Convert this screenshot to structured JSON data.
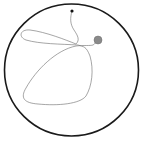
{
  "diagram": {
    "type": "morris-water-maze-trajectory",
    "pool": {
      "cx": 71.5,
      "cy": 70,
      "rx": 67,
      "ry": 66,
      "stroke": "#1a1a1a",
      "stroke_width": 1.6
    },
    "start_point": {
      "cx": 72,
      "cy": 11,
      "r": 1.6,
      "color": "#111111"
    },
    "platform": {
      "cx": 98,
      "cy": 40,
      "r": 4,
      "color": "#8a8a8a",
      "stroke": "#6e6e6e"
    },
    "trajectory": {
      "color": "#6a6a6a",
      "stroke_width": 0.6,
      "path": "M72,11 C70,18 70,24 74,30 C78,36 80,40 76,44 C66,40 46,32 30,30 C20,29 18,37 26,40 C40,44 60,44 78,45 C84,47 86,46 90,56 C94,70 92,86 86,96 C80,104 58,106 38,104 C24,103 20,98 26,88 C36,70 56,50 76,46 C84,45 90,46 93,45 C95,44 96,42 98,40"
    }
  }
}
